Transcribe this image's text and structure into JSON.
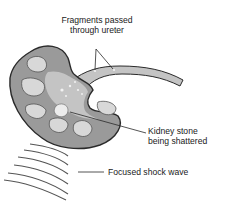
{
  "figure": {
    "labels": {
      "fragments_line1": "Fragments passed",
      "fragments_line2": "through ureter",
      "stone_line1": "Kidney stone",
      "stone_line2": "being shattered",
      "shockwave": "Focused shock wave"
    },
    "colors": {
      "kidney_fill": "#9a9a9a",
      "inner_fill": "#c4c4c4",
      "calyx_fill": "#d8d8d8",
      "outline": "#2a2a2a",
      "wave": "#555555",
      "fragment": "#f2f2f2"
    }
  }
}
